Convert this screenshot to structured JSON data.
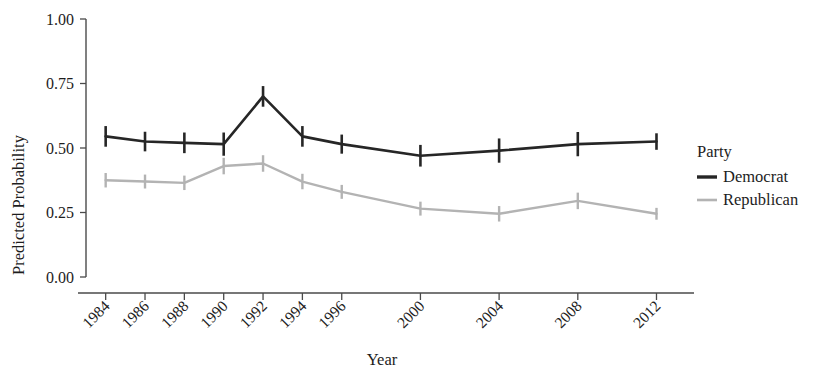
{
  "chart_data": {
    "type": "line",
    "title": "",
    "subtitle": "",
    "xlabel": "Year",
    "ylabel": "Predicted Probability",
    "x": [
      1984,
      1986,
      1988,
      1990,
      1992,
      1994,
      1996,
      2000,
      2004,
      2008,
      2012
    ],
    "categories": [
      "1984",
      "1986",
      "1988",
      "1990",
      "1992",
      "1994",
      "1996",
      "2000",
      "2004",
      "2008",
      "2012"
    ],
    "xtick_labels": [
      "1984",
      "1986",
      "1988",
      "1990",
      "1992",
      "1994",
      "1996",
      "2000",
      "2004",
      "2008",
      "2012"
    ],
    "ytick_labels": [
      "0.00",
      "0.25",
      "0.50",
      "0.75",
      "1.00"
    ],
    "ytick_values": [
      0.0,
      0.25,
      0.5,
      0.75,
      1.0
    ],
    "ylim": [
      0.0,
      1.0
    ],
    "xlim": [
      1983.0,
      2013.5
    ],
    "grid": false,
    "legend_position": "right",
    "legend_title": "Party",
    "series": [
      {
        "name": "Democrat",
        "color": "#262626",
        "values": [
          0.545,
          0.525,
          0.52,
          0.515,
          0.7,
          0.545,
          0.515,
          0.47,
          0.49,
          0.515,
          0.525
        ],
        "err_low": [
          0.505,
          0.487,
          0.48,
          0.47,
          0.66,
          0.505,
          0.478,
          0.428,
          0.443,
          0.468,
          0.493
        ],
        "err_high": [
          0.585,
          0.563,
          0.56,
          0.56,
          0.74,
          0.585,
          0.552,
          0.512,
          0.537,
          0.562,
          0.557
        ]
      },
      {
        "name": "Republican",
        "color": "#b3b3b3",
        "values": [
          0.375,
          0.37,
          0.365,
          0.43,
          0.44,
          0.37,
          0.33,
          0.265,
          0.245,
          0.295,
          0.245
        ],
        "err_low": [
          0.347,
          0.343,
          0.337,
          0.398,
          0.408,
          0.34,
          0.303,
          0.238,
          0.215,
          0.263,
          0.222
        ],
        "err_high": [
          0.403,
          0.397,
          0.393,
          0.462,
          0.472,
          0.4,
          0.357,
          0.292,
          0.275,
          0.327,
          0.268
        ]
      }
    ]
  },
  "legend": {
    "title": "Party",
    "entries": [
      {
        "label": "Democrat",
        "color": "#262626"
      },
      {
        "label": "Republican",
        "color": "#b3b3b3"
      }
    ]
  },
  "axes": {
    "x_title": "Year",
    "y_title": "Predicted Probability"
  }
}
